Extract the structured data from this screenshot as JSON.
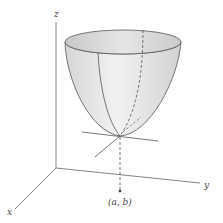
{
  "diagram": {
    "axes": {
      "x_label": "x",
      "y_label": "y",
      "z_label": "z"
    },
    "point_label": "(a, b)",
    "colors": {
      "surface_fill": "#e4e4e4",
      "surface_inner": "#cfcfcf",
      "stroke": "#555555",
      "background": "#ffffff"
    }
  }
}
